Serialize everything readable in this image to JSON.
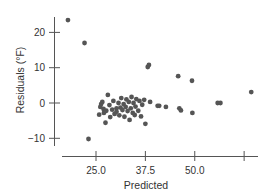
{
  "chart_data": {
    "type": "scatter",
    "title": "",
    "xlabel": "Predicted",
    "ylabel": "Residuals (°F)",
    "xlim": [
      16.5,
      66.5
    ],
    "ylim": [
      -14.7,
      26
    ],
    "grid": false,
    "legend": null,
    "x_ticks": [
      25.0,
      37.5,
      50.0,
      62.5
    ],
    "x_tick_labels": [
      "25.0",
      "37.5",
      "50.0",
      ""
    ],
    "y_ticks": [
      -10,
      0,
      10,
      20
    ],
    "y_tick_labels": [
      "-10",
      "0",
      "10",
      "20"
    ],
    "point_color": "#555555",
    "points": [
      {
        "x": 17.9,
        "y": 23.5
      },
      {
        "x": 22.1,
        "y": 17.0
      },
      {
        "x": 23.1,
        "y": -10.2
      },
      {
        "x": 25.8,
        "y": -3.3
      },
      {
        "x": 26.1,
        "y": -1.1
      },
      {
        "x": 26.6,
        "y": 0.3
      },
      {
        "x": 26.3,
        "y": -0.3
      },
      {
        "x": 26.9,
        "y": -1.7
      },
      {
        "x": 27.6,
        "y": -2.2
      },
      {
        "x": 27.0,
        "y": -2.8
      },
      {
        "x": 27.4,
        "y": -5.6
      },
      {
        "x": 28.0,
        "y": 2.3
      },
      {
        "x": 28.4,
        "y": -0.6
      },
      {
        "x": 28.6,
        "y": -4.0
      },
      {
        "x": 29.1,
        "y": -1.9
      },
      {
        "x": 29.4,
        "y": 0.6
      },
      {
        "x": 29.7,
        "y": -3.1
      },
      {
        "x": 30.2,
        "y": -1.5
      },
      {
        "x": 30.2,
        "y": -2.5
      },
      {
        "x": 30.7,
        "y": 0.0
      },
      {
        "x": 30.9,
        "y": -3.5
      },
      {
        "x": 31.2,
        "y": -1.3
      },
      {
        "x": 31.4,
        "y": 1.4
      },
      {
        "x": 31.7,
        "y": -2.0
      },
      {
        "x": 32.0,
        "y": -0.3
      },
      {
        "x": 32.2,
        "y": -3.9
      },
      {
        "x": 32.5,
        "y": -1.1
      },
      {
        "x": 32.7,
        "y": 1.0
      },
      {
        "x": 33.0,
        "y": -2.3
      },
      {
        "x": 33.3,
        "y": 0.3
      },
      {
        "x": 33.5,
        "y": -4.8
      },
      {
        "x": 33.8,
        "y": -1.5
      },
      {
        "x": 34.0,
        "y": 1.7
      },
      {
        "x": 34.3,
        "y": -2.8
      },
      {
        "x": 34.5,
        "y": 0.0
      },
      {
        "x": 34.8,
        "y": -3.4
      },
      {
        "x": 35.0,
        "y": -1.0
      },
      {
        "x": 35.2,
        "y": 1.1
      },
      {
        "x": 35.7,
        "y": -2.2
      },
      {
        "x": 36.0,
        "y": 0.6
      },
      {
        "x": 36.4,
        "y": -3.8
      },
      {
        "x": 36.7,
        "y": -0.5
      },
      {
        "x": 37.2,
        "y": 0.9
      },
      {
        "x": 37.5,
        "y": -5.9
      },
      {
        "x": 38.1,
        "y": 10.2
      },
      {
        "x": 38.4,
        "y": 10.8
      },
      {
        "x": 38.7,
        "y": 0.3
      },
      {
        "x": 40.6,
        "y": -0.8
      },
      {
        "x": 41.0,
        "y": -0.8
      },
      {
        "x": 42.7,
        "y": -1.1
      },
      {
        "x": 45.8,
        "y": 7.6
      },
      {
        "x": 46.1,
        "y": -1.5
      },
      {
        "x": 46.5,
        "y": -2.1
      },
      {
        "x": 49.3,
        "y": 6.3
      },
      {
        "x": 49.4,
        "y": -2.8
      },
      {
        "x": 55.8,
        "y": 0.0
      },
      {
        "x": 56.5,
        "y": 0.0
      },
      {
        "x": 64.3,
        "y": 3.1
      }
    ]
  }
}
